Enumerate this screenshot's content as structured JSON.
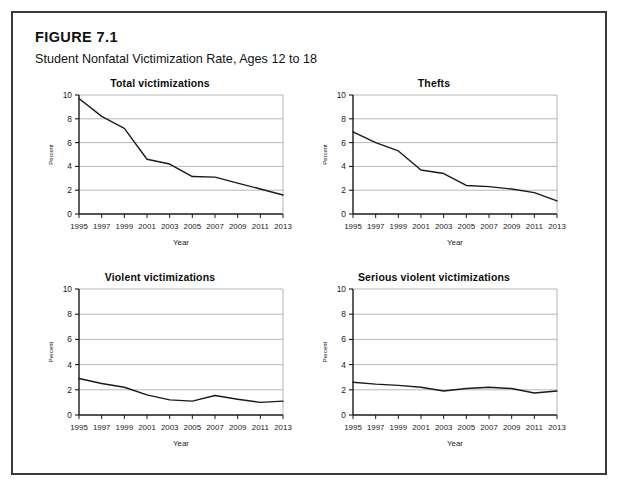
{
  "figure": {
    "label": "FIGURE 7.1",
    "subtitle": "Student Nonfatal Victimization Rate, Ages 12 to 18"
  },
  "axis": {
    "ylabel": "Percent",
    "xlabel": "Year",
    "yticks": [
      "0",
      "2",
      "4",
      "6",
      "8",
      "10"
    ],
    "xticks": [
      "1995",
      "1997",
      "1999",
      "2001",
      "2003",
      "2005",
      "2007",
      "2009",
      "2011",
      "2013"
    ]
  },
  "colors": {
    "line": "#1a1a1a",
    "grid": "#9a9a9a",
    "axis": "#1a1a1a",
    "border": "#3a3a3a",
    "background": "#ffffff"
  },
  "panels": [
    {
      "title": "Total victimizations"
    },
    {
      "title": "Thefts"
    },
    {
      "title": "Violent victimizations"
    },
    {
      "title": "Serious violent victimizations"
    }
  ],
  "chart_data": [
    {
      "type": "line",
      "title": "Total victimizations",
      "xlabel": "Year",
      "ylabel": "Percent",
      "xlim": [
        1995,
        2013
      ],
      "ylim": [
        0,
        10
      ],
      "grid": true,
      "legend": "none",
      "x": [
        1995,
        1997,
        1999,
        2001,
        2003,
        2005,
        2007,
        2009,
        2011,
        2013
      ],
      "values": [
        9.7,
        8.2,
        7.2,
        4.6,
        4.2,
        3.15,
        3.1,
        2.6,
        2.1,
        1.6
      ]
    },
    {
      "type": "line",
      "title": "Thefts",
      "xlabel": "Year",
      "ylabel": "Percent",
      "xlim": [
        1995,
        2013
      ],
      "ylim": [
        0,
        10
      ],
      "grid": true,
      "legend": "none",
      "x": [
        1995,
        1997,
        1999,
        2001,
        2003,
        2005,
        2007,
        2009,
        2011,
        2013
      ],
      "values": [
        6.9,
        6.0,
        5.3,
        3.7,
        3.4,
        2.4,
        2.3,
        2.1,
        1.8,
        1.1
      ]
    },
    {
      "type": "line",
      "title": "Violent victimizations",
      "xlabel": "Year",
      "ylabel": "Percent",
      "xlim": [
        1995,
        2013
      ],
      "ylim": [
        0,
        10
      ],
      "grid": true,
      "legend": "none",
      "x": [
        1995,
        1997,
        1999,
        2001,
        2003,
        2005,
        2007,
        2009,
        2011,
        2013
      ],
      "values": [
        2.9,
        2.5,
        2.2,
        1.6,
        1.2,
        1.1,
        1.55,
        1.25,
        1.0,
        1.1
      ]
    },
    {
      "type": "line",
      "title": "Serious violent victimizations",
      "xlabel": "Year",
      "ylabel": "Percent",
      "xlim": [
        1995,
        2013
      ],
      "ylim": [
        0,
        10
      ],
      "grid": true,
      "legend": "none",
      "x": [
        1995,
        1997,
        1999,
        2001,
        2003,
        2005,
        2007,
        2009,
        2011,
        2013
      ],
      "values": [
        2.6,
        2.45,
        2.35,
        2.2,
        1.9,
        2.1,
        2.2,
        2.1,
        1.75,
        1.9
      ]
    }
  ]
}
